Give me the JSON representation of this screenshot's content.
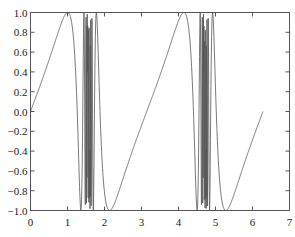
{
  "chart_data": {
    "type": "line",
    "title": "",
    "xlabel": "",
    "ylabel": "",
    "function": "y = sin(tan(x))",
    "x_range_data": [
      0,
      6.2832
    ],
    "xlim": [
      0,
      7
    ],
    "ylim": [
      -1.0,
      1.0
    ],
    "x_ticks": [
      0,
      1,
      2,
      3,
      4,
      5,
      6,
      7
    ],
    "x_tick_labels": [
      "0",
      "1",
      "2",
      "3",
      "4",
      "5",
      "6",
      "7"
    ],
    "y_ticks": [
      -1.0,
      -0.8,
      -0.6,
      -0.4,
      -0.2,
      0.0,
      0.2,
      0.4,
      0.6,
      0.8,
      1.0
    ],
    "y_tick_labels": [
      "−1.0",
      "−0.8",
      "−0.6",
      "−0.4",
      "−0.2",
      "0.0",
      "0.2",
      "0.4",
      "0.6",
      "0.8",
      "1.0"
    ],
    "grid": false,
    "legend": null,
    "line_color": "#555555",
    "samples": 1000,
    "series": [
      {
        "name": "sin(tan(x))",
        "key_points": [
          {
            "x": 0.0,
            "y": 0.0
          },
          {
            "x": 1.0,
            "y": 1.0
          },
          {
            "x": 1.5708,
            "y": "oscillates rapidly between -1 and 1"
          },
          {
            "x": 2.14,
            "y": -1.0
          },
          {
            "x": 3.1416,
            "y": 0.0
          },
          {
            "x": 4.14,
            "y": 1.0
          },
          {
            "x": 4.7124,
            "y": "oscillates rapidly between -1 and 1"
          },
          {
            "x": 5.28,
            "y": -1.0
          },
          {
            "x": 6.2832,
            "y": 0.0
          }
        ]
      }
    ]
  }
}
